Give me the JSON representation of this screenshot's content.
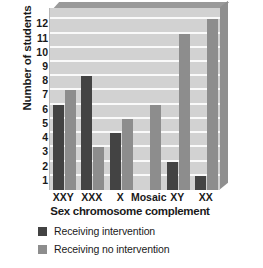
{
  "chart_data": {
    "type": "bar",
    "title": "",
    "subtitle": "",
    "xlabel": "Sex chromosome complement",
    "ylabel": "Number of students",
    "categories": [
      "XXY",
      "XXX",
      "X",
      "Mosaic",
      "XY",
      "XX"
    ],
    "series": [
      {
        "name": "Receiving intervention",
        "color": "#434343",
        "values": [
          6,
          8,
          4,
          0,
          2,
          1
        ]
      },
      {
        "name": "Receiving no intervention",
        "color": "#8d8d8d",
        "values": [
          7,
          3,
          5,
          6,
          11,
          12
        ]
      }
    ],
    "ylim": [
      0,
      12.8
    ],
    "ytick_labels": [
      "1",
      "2",
      "3",
      "4",
      "5",
      "6",
      "7",
      "8",
      "9",
      "10",
      "11",
      "12"
    ],
    "ytick_values": [
      1,
      2,
      3,
      4,
      5,
      6,
      7,
      8,
      9,
      10,
      11,
      12
    ],
    "grid": true,
    "grid_orientation": "horizontal",
    "legend_position": "below",
    "plot_background": "#d2d2d2",
    "gridline_color": "#fafafa"
  },
  "axes": {
    "y_title": "Number of students",
    "x_title": "Sex chromosome complement"
  },
  "legend": {
    "items": [
      {
        "label": "Receiving intervention",
        "color": "#434343"
      },
      {
        "label": "Receiving no intervention",
        "color": "#8d8d8d"
      }
    ]
  },
  "neighbor_chart": {
    "y_title": "Number of students"
  }
}
